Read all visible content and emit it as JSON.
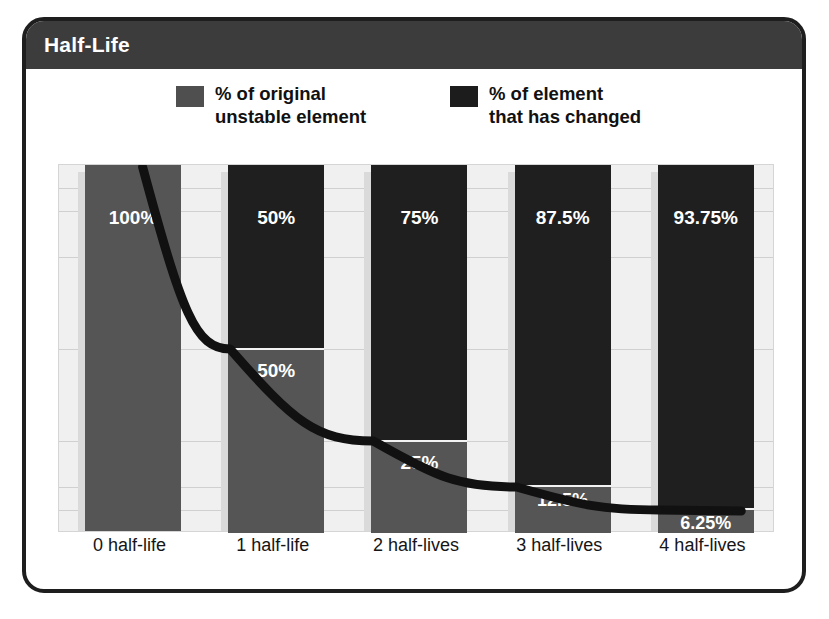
{
  "figure": {
    "title": "Half-Life",
    "title_bar_color": "#3c3c3c",
    "frame_border_color": "#1e1e1e",
    "plot_background": "#eff0ef"
  },
  "legend": {
    "position": "top",
    "items": [
      {
        "label": "% of original\nunstable element",
        "color": "#4f4f4f",
        "key": "original"
      },
      {
        "label": "% of element\nthat has changed",
        "color": "#1c1c1c",
        "key": "changed"
      }
    ]
  },
  "chart_data": {
    "type": "bar",
    "title": "Half-Life",
    "xlabel": "",
    "ylabel": "",
    "ylim": [
      0,
      100
    ],
    "grid": true,
    "stacked": true,
    "categories": [
      "0 half-life",
      "1 half-life",
      "2 half-lives",
      "3 half-lives",
      "4 half-lives"
    ],
    "series": [
      {
        "name": "% of element that has changed",
        "color": "#1f1f1f",
        "values": [
          0,
          50,
          75,
          87.5,
          93.75
        ],
        "labels": [
          "",
          "50%",
          "75%",
          "87.5%",
          "93.75%"
        ]
      },
      {
        "name": "% of original unstable element",
        "color": "#555555",
        "values": [
          100,
          50,
          25,
          12.5,
          6.25
        ],
        "labels": [
          "100%",
          "50%",
          "25%",
          "12.5%",
          "6.25%"
        ]
      }
    ],
    "gridline_values": [
      93.75,
      87.5,
      75,
      50,
      25,
      12.5,
      6.25
    ],
    "overlay_curve": {
      "name": "exponential decay of remaining unstable element",
      "color": "#111111",
      "x": [
        0,
        1,
        2,
        3,
        4
      ],
      "y": [
        100,
        50,
        25,
        12.5,
        6.25
      ]
    }
  },
  "x_axis": {
    "ticks": [
      "0 half-life",
      "1 half-life",
      "2 half-lives",
      "3 half-lives",
      "4 half-lives"
    ]
  },
  "bars": [
    {
      "category": "0 half-life",
      "changed_pct": 0,
      "changed_label": "",
      "original_pct": 100,
      "original_label": "100%"
    },
    {
      "category": "1 half-life",
      "changed_pct": 50,
      "changed_label": "50%",
      "original_pct": 50,
      "original_label": "50%"
    },
    {
      "category": "2 half-lives",
      "changed_pct": 75,
      "changed_label": "75%",
      "original_pct": 25,
      "original_label": "25%"
    },
    {
      "category": "3 half-lives",
      "changed_pct": 87.5,
      "changed_label": "87.5%",
      "original_pct": 12.5,
      "original_label": "12.5%"
    },
    {
      "category": "4 half-lives",
      "changed_pct": 93.75,
      "changed_label": "93.75%",
      "original_pct": 6.25,
      "original_label": "6.25%"
    }
  ]
}
